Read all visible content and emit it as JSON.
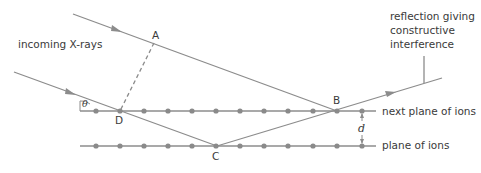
{
  "colors": {
    "line": "#8c8c8c",
    "dot": "#8a8a8a",
    "text": "#3a3a3a",
    "background": "#ffffff"
  },
  "labels": {
    "incoming": "incoming X-rays",
    "reflection": [
      "reflection giving",
      "constructive",
      "interference"
    ],
    "next_plane": "next plane of ions",
    "plane": "plane of ions",
    "spacing": "d",
    "angle": "θ"
  },
  "points": {
    "A": "A",
    "B": "B",
    "C": "C",
    "D": "D"
  },
  "planes": {
    "upper_y": 111,
    "lower_y": 146,
    "x_start": 80,
    "x_end": 376,
    "ion_x": [
      96,
      120,
      144,
      168,
      192,
      216,
      240,
      264,
      288,
      313,
      337,
      362
    ]
  }
}
